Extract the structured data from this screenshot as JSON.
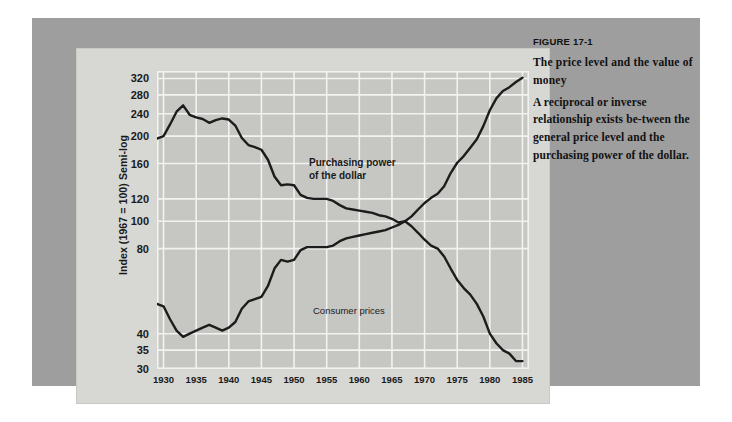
{
  "figure": {
    "number_label": "FIGURE 17-1",
    "title": "The price level and\nthe value of money",
    "body": "A reciprocal or inverse relationship exists be-tween the general price level and the purchasing power of the dollar."
  },
  "colors": {
    "page_background": "#ffffff",
    "panel_background": "#9e9e9e",
    "card_background": "#d7d7d4",
    "plot_background": "#c6c6c3",
    "gridline": "#f2f2f0",
    "series_line": "#1c1c1c",
    "text": "#111111"
  },
  "chart_data": {
    "type": "line",
    "title": "",
    "subtitle": "",
    "xlabel": "",
    "ylabel": "Index (1967 = 100) Semi-log",
    "scale": "semi-log",
    "grid": true,
    "legend_position": "inline-annotation",
    "xlim": [
      1929,
      1986
    ],
    "ylim": [
      30,
      340
    ],
    "xticks": [
      1930,
      1935,
      1940,
      1945,
      1950,
      1955,
      1960,
      1965,
      1970,
      1975,
      1980,
      1985
    ],
    "xticklabels": [
      "1930",
      "1935",
      "1940",
      "1945",
      "1950",
      "1955",
      "1960",
      "1965",
      "1970",
      "1975",
      "1980",
      "1985"
    ],
    "yticks": [
      320,
      280,
      240,
      200,
      160,
      120,
      100,
      80,
      40,
      35,
      30
    ],
    "yticklabels": [
      "320",
      "280",
      "240",
      "200",
      "160",
      "120",
      "100",
      "80",
      "40",
      "35",
      "30"
    ],
    "annotations": [
      {
        "text": "Purchasing power\nof the dollar",
        "series": "Purchasing power of the dollar"
      },
      {
        "text": "Consumer prices",
        "series": "Consumer prices"
      }
    ],
    "x": [
      1929,
      1930,
      1931,
      1932,
      1933,
      1934,
      1935,
      1936,
      1937,
      1938,
      1939,
      1940,
      1941,
      1942,
      1943,
      1944,
      1945,
      1946,
      1947,
      1948,
      1949,
      1950,
      1951,
      1952,
      1953,
      1954,
      1955,
      1956,
      1957,
      1958,
      1959,
      1960,
      1961,
      1962,
      1963,
      1964,
      1965,
      1966,
      1967,
      1968,
      1969,
      1970,
      1971,
      1972,
      1973,
      1974,
      1975,
      1976,
      1977,
      1978,
      1979,
      1980,
      1981,
      1982,
      1983,
      1984,
      1985
    ],
    "series": [
      {
        "name": "Purchasing power of the dollar",
        "values": [
          196,
          200,
          220,
          244,
          257,
          238,
          233,
          230,
          223,
          228,
          231,
          229,
          218,
          197,
          186,
          183,
          179,
          165,
          144,
          134,
          135,
          134,
          124,
          121,
          120,
          120,
          120,
          118,
          114,
          111,
          110,
          109,
          108,
          107,
          105,
          104,
          102,
          99,
          100,
          96,
          91,
          86,
          82,
          80,
          75,
          68,
          62,
          58,
          55,
          51,
          46,
          40,
          37,
          35,
          34,
          32,
          32
        ]
      },
      {
        "name": "Consumer prices",
        "values": [
          51,
          50,
          45,
          41,
          39,
          40,
          41,
          42,
          43,
          42,
          41,
          42,
          44,
          49,
          52,
          53,
          54,
          59,
          68,
          73,
          72,
          73,
          79,
          81,
          81,
          81,
          81,
          82,
          85,
          87,
          88,
          89,
          90,
          91,
          92,
          93,
          95,
          97,
          100,
          104,
          110,
          116,
          121,
          125,
          133,
          148,
          161,
          170,
          182,
          195,
          217,
          247,
          272,
          289,
          298,
          311,
          322
        ]
      }
    ]
  }
}
